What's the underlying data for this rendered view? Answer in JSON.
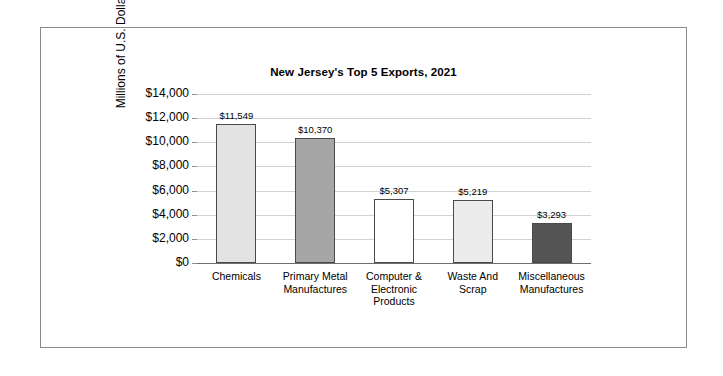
{
  "frame": {
    "border_color": "#8a8a8a"
  },
  "chart_data": {
    "type": "bar",
    "title": "New Jersey's Top 5 Exports, 2021",
    "xlabel": "",
    "ylabel": "Millions of U.S. Dollars",
    "ylim": [
      0,
      14000
    ],
    "ytick_step": 2000,
    "grid": true,
    "legend": "none",
    "categories": [
      "Chemicals",
      "Primary Metal Manufactures",
      "Computer & Electronic Products",
      "Waste And Scrap",
      "Miscellaneous Manufactures"
    ],
    "category_lines": [
      [
        "Chemicals"
      ],
      [
        "Primary Metal",
        "Manufactures"
      ],
      [
        "Computer &",
        "Electronic",
        "Products"
      ],
      [
        "Waste And",
        "Scrap"
      ],
      [
        "Miscellaneous",
        "Manufactures"
      ]
    ],
    "values": [
      11549,
      10370,
      5307,
      5219,
      3293
    ],
    "value_labels": [
      "$11,549",
      "$10,370",
      "$5,307",
      "$5,219",
      "$3,293"
    ],
    "bar_colors": [
      "#e3e3e3",
      "#a6a6a6",
      "#ffffff",
      "#ececec",
      "#545454"
    ],
    "bar_border_color": "#4a4a4a",
    "ytick_labels": [
      "$14,000",
      "$12,000",
      "$10,000",
      "$8,000",
      "$6,000",
      "$4,000",
      "$2,000",
      "$0"
    ],
    "ytick_values": [
      14000,
      12000,
      10000,
      8000,
      6000,
      4000,
      2000,
      0
    ],
    "gridline_color": "#d2d2d2",
    "axis_color": "#6e6e6e"
  }
}
